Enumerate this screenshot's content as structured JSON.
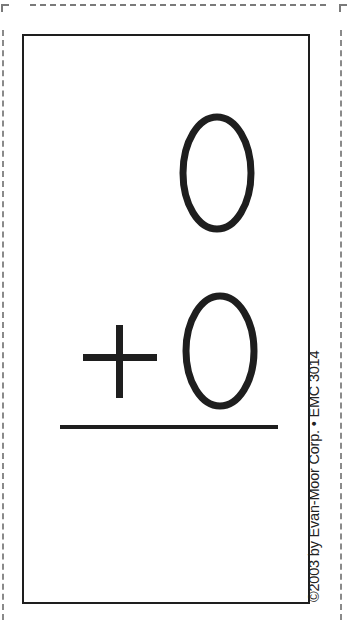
{
  "flashcard": {
    "top_number": "0",
    "operator": "+",
    "bottom_number": "0",
    "operation": "addition",
    "answer_line": true
  },
  "footer": {
    "copyright": "©2003 by Evan-Moor Corp. • EMC 3014"
  },
  "colors": {
    "ink": "#1e1e1e",
    "cut_line": "#7a7a7a",
    "background": "#ffffff"
  }
}
